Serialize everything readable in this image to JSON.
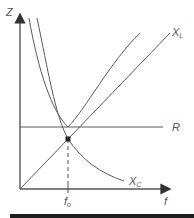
{
  "diagram": {
    "type": "series RLC impedance vs frequency",
    "axes": {
      "y_label": "Z",
      "x_label": "f"
    },
    "curves": [
      {
        "name": "X_L",
        "label_main": "X",
        "label_sub": "L",
        "shape": "straight line through origin"
      },
      {
        "name": "R",
        "label_main": "R",
        "label_sub": "",
        "shape": "horizontal line"
      },
      {
        "name": "X_C",
        "label_main": "X",
        "label_sub": "C",
        "shape": "hyperbolic decreasing curve"
      },
      {
        "name": "Z",
        "label_main": "",
        "label_sub": "",
        "shape": "U-shaped total impedance curve, minimum at f_o equal to R"
      }
    ],
    "marker": {
      "label_main": "f",
      "label_sub": "o",
      "meaning": "resonant frequency where X_L = X_C"
    },
    "colors": {
      "line": "#5a5a5a",
      "axis": "#555555",
      "bar": "#1e1e1e"
    }
  }
}
